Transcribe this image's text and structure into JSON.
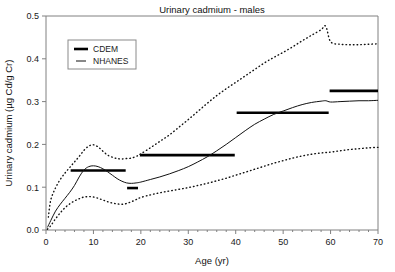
{
  "chart_data": {
    "type": "line",
    "title": "Urinary cadmium - males",
    "xlabel": "Age (yr)",
    "ylabel": "Urinary cadmium (µg Cd/g Cr)",
    "xlim": [
      0,
      70
    ],
    "ylim": [
      0,
      0.5
    ],
    "xticks": [
      0,
      10,
      20,
      30,
      40,
      50,
      60,
      70
    ],
    "xtick_labels": [
      "0",
      "10",
      "20",
      "30",
      "40",
      "50",
      "60",
      "70"
    ],
    "yticks": [
      0.0,
      0.1,
      0.2,
      0.3,
      0.4,
      0.5
    ],
    "ytick_labels": [
      "0.0",
      "0.1",
      "0.2",
      "0.3",
      "0.4",
      "0.5"
    ],
    "grid": false,
    "legend_position": "upper-left",
    "series": [
      {
        "name": "CDEM",
        "style": "thick-horizontal-segments",
        "color": "#000000",
        "segments": [
          {
            "x0": 5.2,
            "x1": 16.8,
            "y": 0.139
          },
          {
            "x0": 17.1,
            "x1": 19.4,
            "y": 0.098
          },
          {
            "x0": 19.8,
            "x1": 39.8,
            "y": 0.175
          },
          {
            "x0": 40.2,
            "x1": 59.6,
            "y": 0.274
          },
          {
            "x0": 59.8,
            "x1": 70.0,
            "y": 0.325
          }
        ]
      },
      {
        "name": "NHANES",
        "style": "solid-line",
        "color": "#111111",
        "x": [
          0.3,
          1,
          2,
          3,
          4,
          5,
          6,
          7,
          8,
          9,
          10,
          11,
          12,
          13,
          14,
          15,
          16,
          17,
          18,
          19,
          20,
          22,
          24,
          26,
          28,
          30,
          32,
          34,
          36,
          38,
          40,
          42,
          44,
          46,
          48,
          50,
          52,
          54,
          56,
          58,
          59,
          60,
          62,
          64,
          66,
          68,
          70
        ],
        "y": [
          0.006,
          0.022,
          0.044,
          0.06,
          0.074,
          0.088,
          0.104,
          0.124,
          0.14,
          0.148,
          0.15,
          0.148,
          0.143,
          0.136,
          0.128,
          0.12,
          0.114,
          0.11,
          0.109,
          0.11,
          0.112,
          0.118,
          0.124,
          0.131,
          0.139,
          0.148,
          0.159,
          0.171,
          0.185,
          0.2,
          0.216,
          0.232,
          0.247,
          0.259,
          0.27,
          0.278,
          0.286,
          0.293,
          0.298,
          0.301,
          0.302,
          0.299,
          0.3,
          0.301,
          0.302,
          0.302,
          0.303
        ]
      },
      {
        "name": "NHANES upper confidence limit",
        "style": "dotted-line",
        "color": "#111111",
        "x": [
          0.5,
          1,
          2,
          3,
          4,
          5,
          6,
          7,
          8,
          9,
          10,
          11,
          12,
          13,
          14,
          15,
          16,
          17,
          18,
          19,
          20,
          22,
          24,
          26,
          28,
          30,
          32,
          34,
          36,
          38,
          40,
          42,
          44,
          46,
          48,
          50,
          52,
          54,
          56,
          58,
          59,
          60,
          62,
          64,
          66,
          68,
          70
        ],
        "y": [
          0.03,
          0.07,
          0.098,
          0.118,
          0.133,
          0.146,
          0.159,
          0.172,
          0.186,
          0.196,
          0.199,
          0.194,
          0.184,
          0.175,
          0.17,
          0.167,
          0.166,
          0.167,
          0.168,
          0.172,
          0.178,
          0.192,
          0.207,
          0.222,
          0.24,
          0.258,
          0.277,
          0.296,
          0.314,
          0.33,
          0.345,
          0.36,
          0.375,
          0.39,
          0.403,
          0.415,
          0.428,
          0.442,
          0.455,
          0.468,
          0.476,
          0.44,
          0.434,
          0.433,
          0.433,
          0.434,
          0.435
        ]
      },
      {
        "name": "NHANES lower confidence limit",
        "style": "dotted-line",
        "color": "#111111",
        "x": [
          0.3,
          1,
          2,
          3,
          4,
          5,
          6,
          7,
          8,
          9,
          10,
          11,
          12,
          13,
          14,
          15,
          16,
          17,
          18,
          19,
          20,
          22,
          24,
          26,
          28,
          30,
          32,
          34,
          36,
          38,
          40,
          42,
          44,
          46,
          48,
          50,
          52,
          54,
          56,
          58,
          60,
          62,
          64,
          66,
          68,
          70
        ],
        "y": [
          0.002,
          0.01,
          0.026,
          0.04,
          0.052,
          0.061,
          0.068,
          0.073,
          0.077,
          0.078,
          0.077,
          0.074,
          0.07,
          0.066,
          0.063,
          0.061,
          0.06,
          0.062,
          0.066,
          0.071,
          0.076,
          0.082,
          0.087,
          0.091,
          0.095,
          0.099,
          0.104,
          0.109,
          0.115,
          0.121,
          0.128,
          0.135,
          0.142,
          0.149,
          0.156,
          0.162,
          0.168,
          0.173,
          0.177,
          0.18,
          0.182,
          0.185,
          0.188,
          0.19,
          0.192,
          0.193
        ]
      }
    ],
    "legend_entries": [
      {
        "label": "CDEM",
        "style": "thick"
      },
      {
        "label": "NHANES",
        "style": "thin"
      }
    ]
  }
}
